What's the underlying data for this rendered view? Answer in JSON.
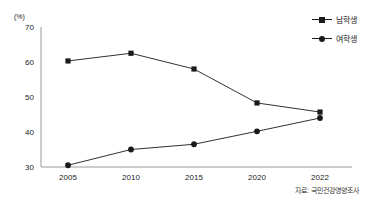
{
  "chart_data": {
    "type": "line",
    "title": "",
    "subtitle": "",
    "xlabel": "",
    "ylabel": "(%)",
    "unit_label": "(%)",
    "categories": [
      "2005",
      "2010",
      "2015",
      "2020",
      "2022"
    ],
    "x": [
      2005,
      2010,
      2015,
      2020,
      2022
    ],
    "series": [
      {
        "name": "남학생",
        "marker": "square",
        "color": "#1a1a1a",
        "values": [
          60.3,
          62.5,
          58.0,
          48.3,
          45.7
        ]
      },
      {
        "name": "여학생",
        "marker": "circle",
        "color": "#1a1a1a",
        "values": [
          30.5,
          35.0,
          36.5,
          40.2,
          44.0
        ]
      }
    ],
    "ylim": [
      30,
      70
    ],
    "yticks": [
      70,
      60,
      50,
      40,
      30
    ],
    "ytick_labels": [
      "70",
      "60",
      "50",
      "40",
      "30"
    ],
    "xtick_labels": [
      "2005",
      "2010",
      "2015",
      "2020",
      "2022"
    ],
    "grid": false,
    "legend_position": "top-right",
    "source_note": "자료: 국민건강영양조사"
  },
  "legend": {
    "items": [
      {
        "label": "남학생",
        "marker": "square"
      },
      {
        "label": "여학생",
        "marker": "circle"
      }
    ]
  },
  "axes": {
    "unit": "(%)",
    "y_labels": [
      "70",
      "60",
      "50",
      "40",
      "30"
    ],
    "x_labels": [
      "2005",
      "2010",
      "2015",
      "2020",
      "2022"
    ]
  },
  "footer": {
    "source": "자료: 국민건강영양조사"
  },
  "colors": {
    "ink": "#1a1a1a",
    "axis": "#999999",
    "background": "#ffffff"
  }
}
